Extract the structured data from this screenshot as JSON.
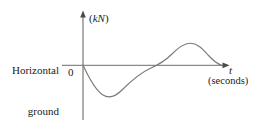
{
  "figure": {
    "name": "horizontal-ground-reaction-force-graph",
    "background_color": "#ffffff",
    "axis_color": "#6b6b6b",
    "curve_color": "#7a7a7a",
    "text_color": "#1a1a1a"
  },
  "labels": {
    "series_line1": "Horizontal",
    "series_line2": "ground",
    "series_line3": "reaction",
    "series_line4": "force",
    "y_axis_unit": "(kN)",
    "y_axis_unit_open": "(",
    "y_axis_unit_symbol": "kN",
    "y_axis_unit_close": ")",
    "origin": "0",
    "x_axis_variable": "t",
    "x_axis_unit": "(seconds)"
  },
  "chart_data": {
    "type": "line",
    "title": "",
    "subtitle": "",
    "xlabel": "t (seconds)",
    "ylabel": "(kN)",
    "series_name": "Horizontal ground reaction force",
    "grid": false,
    "legend": false,
    "axis_origin_label": "0",
    "x_axis_ticks": [],
    "y_axis_ticks": [],
    "xlim": [
      0,
      1
    ],
    "ylim": [
      -1,
      1
    ],
    "annotations": [
      {
        "label": "start",
        "x": 0.0,
        "y": 0.0
      },
      {
        "label": "trough (braking minimum)",
        "x": 0.17,
        "y": -0.55
      },
      {
        "label": "zero crossing",
        "x": 0.49,
        "y": 0.0
      },
      {
        "label": "peak (propulsion maximum)",
        "x": 0.72,
        "y": 0.42
      },
      {
        "label": "end (toe-off)",
        "x": 0.95,
        "y": 0.0
      }
    ],
    "x": [
      0.0,
      0.04,
      0.09,
      0.13,
      0.17,
      0.22,
      0.27,
      0.32,
      0.38,
      0.43,
      0.49,
      0.55,
      0.61,
      0.66,
      0.72,
      0.78,
      0.84,
      0.89,
      0.95
    ],
    "y": [
      0.0,
      -0.22,
      -0.42,
      -0.53,
      -0.55,
      -0.52,
      -0.45,
      -0.36,
      -0.26,
      -0.14,
      0.0,
      0.15,
      0.29,
      0.38,
      0.42,
      0.39,
      0.28,
      0.15,
      0.0
    ]
  },
  "geometry": {
    "y_axis": {
      "x": 83,
      "y_top": 12,
      "y_bottom": 120
    },
    "x_axis": {
      "y": 65,
      "x_left": 62,
      "x_right": 228
    },
    "curve_path": "M 83,65 C 88,76 95,90 103,95 C 110,99.5 116,96 122,90 C 130,82 140,73 150,68.5 C 158,65 165,61 172,54 C 179,47 184,43.5 190,43.3 C 197,43.2 202,48 208,55 C 213,60.5 218,64 222,65.6"
  }
}
